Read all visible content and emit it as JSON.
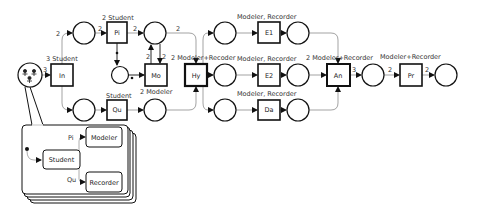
{
  "diagram": {
    "type": "petri-net",
    "colors": {
      "stroke": "#111111",
      "arc": "#888888",
      "text": "#333333",
      "background": "#ffffff"
    },
    "transitions": [
      {
        "id": "In",
        "label": "In",
        "annotation": "3 Student"
      },
      {
        "id": "Pi",
        "label": "Pi",
        "annotation": "2 Student"
      },
      {
        "id": "Mo",
        "label": "Mo",
        "annotation": "2 Modeler"
      },
      {
        "id": "Qu",
        "label": "Qu",
        "annotation": "Student"
      },
      {
        "id": "Hy",
        "label": "Hy",
        "annotation": "2 Modeler+Recoder"
      },
      {
        "id": "E1",
        "label": "E1",
        "annotation": "Modeler, Recorder"
      },
      {
        "id": "E2",
        "label": "E2",
        "annotation": "Modeler, Recorder"
      },
      {
        "id": "Da",
        "label": "Da",
        "annotation": "Modeler, Recorder"
      },
      {
        "id": "An",
        "label": "An",
        "annotation": "2 Modeler+Recorder"
      },
      {
        "id": "Pr",
        "label": "Pr",
        "annotation": "Modeler+Recorder"
      }
    ],
    "arc_weights": {
      "actor_to_in": "3",
      "in_to_upper": "2",
      "upper_to_pi": "2",
      "pi_to_place": "2",
      "place_to_mo": "2",
      "mo_to_place": "2",
      "place_to_hy": "2",
      "pi_to_middle": "•",
      "middle_to_mo": "•",
      "an_out": "3",
      "to_pr": "2",
      "pr_out": "2"
    },
    "role_model": {
      "states": [
        "Student",
        "Modeler",
        "Recorder"
      ],
      "transitions": [
        "Pi",
        "Qu"
      ]
    }
  }
}
